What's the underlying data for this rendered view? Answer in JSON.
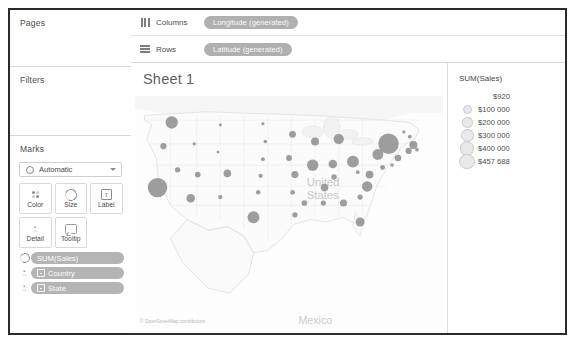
{
  "left_panel": {
    "pages": {
      "title": "Pages"
    },
    "filters": {
      "title": "Filters"
    },
    "marks": {
      "title": "Marks",
      "mark_type": "Automatic",
      "buttons": [
        {
          "label": "Color",
          "icon": "color-dots-icon"
        },
        {
          "label": "Size",
          "icon": "size-circle-icon"
        },
        {
          "label": "Label",
          "icon": "label-text-icon"
        },
        {
          "label": "Detail",
          "icon": "detail-icon"
        },
        {
          "label": "Tooltip",
          "icon": "tooltip-icon"
        }
      ],
      "pills": [
        {
          "label": "SUM(Sales)",
          "icon": "size-circle-icon",
          "has_square": false
        },
        {
          "label": "Country",
          "icon": "detail-icon",
          "has_square": true
        },
        {
          "label": "State",
          "icon": "detail-icon",
          "has_square": true
        }
      ]
    }
  },
  "shelves": [
    {
      "name": "Columns",
      "icon": "columns-icon",
      "pill": "Longitude (generated)"
    },
    {
      "name": "Rows",
      "icon": "rows-icon",
      "pill": "Latitude (generated)"
    }
  ],
  "view": {
    "sheet_title": "Sheet 1",
    "map_credit": "© OpenStreetMap contributors",
    "map_labels": [
      {
        "text": "United States",
        "x": 145,
        "y": 98
      },
      {
        "text": "Mexico",
        "x": 142,
        "y": 213
      }
    ]
  },
  "legend": {
    "title": "SUM(Sales)",
    "entries": [
      {
        "value": "$920",
        "size": 2
      },
      {
        "value": "$100 000",
        "size": 7
      },
      {
        "value": "$200 000",
        "size": 9
      },
      {
        "value": "$300 000",
        "size": 11
      },
      {
        "value": "$400 000",
        "size": 12.5
      },
      {
        "value": "$457 688",
        "size": 13.5
      }
    ]
  },
  "chart_data": {
    "type": "scatter",
    "title": "Sheet 1",
    "xlabel": "Longitude (generated)",
    "ylabel": "Latitude (generated)",
    "size_field": "SUM(Sales)",
    "detail_fields": [
      "Country",
      "State"
    ],
    "size_legend": [
      "$920",
      "$100 000",
      "$200 000",
      "$300 000",
      "$400 000",
      "$457 688"
    ],
    "marks": [
      {
        "state": "Washington",
        "x": 31,
        "y": 42,
        "r": 5.2
      },
      {
        "state": "Oregon",
        "x": 24,
        "y": 62,
        "r": 2.6
      },
      {
        "state": "Idaho",
        "x": 50,
        "y": 60,
        "r": 1.4
      },
      {
        "state": "Montana",
        "x": 72,
        "y": 44,
        "r": 1.3
      },
      {
        "state": "North Dakota",
        "x": 108,
        "y": 43,
        "r": 1.3
      },
      {
        "state": "South Dakota",
        "x": 110,
        "y": 58,
        "r": 1.5
      },
      {
        "state": "Minnesota",
        "x": 133,
        "y": 52,
        "r": 2.9
      },
      {
        "state": "Wisconsin",
        "x": 152,
        "y": 58,
        "r": 3.4
      },
      {
        "state": "Michigan",
        "x": 172,
        "y": 56,
        "r": 4.3
      },
      {
        "state": "Wyoming",
        "x": 70,
        "y": 67,
        "r": 1.2
      },
      {
        "state": "Nevada",
        "x": 36,
        "y": 82,
        "r": 2.3
      },
      {
        "state": "California",
        "x": 19,
        "y": 97,
        "r": 8.2
      },
      {
        "state": "Utah",
        "x": 53,
        "y": 86,
        "r": 2.4
      },
      {
        "state": "Colorado",
        "x": 78,
        "y": 85,
        "r": 3.2
      },
      {
        "state": "Nebraska",
        "x": 108,
        "y": 73,
        "r": 1.6
      },
      {
        "state": "Iowa",
        "x": 130,
        "y": 72,
        "r": 2.5
      },
      {
        "state": "Illinois",
        "x": 150,
        "y": 78,
        "r": 4.8
      },
      {
        "state": "Indiana",
        "x": 167,
        "y": 77,
        "r": 3.6
      },
      {
        "state": "Ohio",
        "x": 184,
        "y": 75,
        "r": 5.0
      },
      {
        "state": "Pennsylvania",
        "x": 205,
        "y": 69,
        "r": 4.6
      },
      {
        "state": "New York",
        "x": 214,
        "y": 60,
        "r": 8.6
      },
      {
        "state": "Vermont",
        "x": 227,
        "y": 50,
        "r": 1.4
      },
      {
        "state": "New Hampshire",
        "x": 232,
        "y": 54,
        "r": 1.6
      },
      {
        "state": "Massachusetts",
        "x": 235,
        "y": 61,
        "r": 3.4
      },
      {
        "state": "Rhode Island",
        "x": 238,
        "y": 65,
        "r": 1.6
      },
      {
        "state": "Connecticut",
        "x": 231,
        "y": 66,
        "r": 2.6
      },
      {
        "state": "New Jersey",
        "x": 222,
        "y": 72,
        "r": 2.8
      },
      {
        "state": "Delaware",
        "x": 217,
        "y": 78,
        "r": 1.5
      },
      {
        "state": "Maryland",
        "x": 209,
        "y": 80,
        "r": 2.1
      },
      {
        "state": "Virginia",
        "x": 198,
        "y": 86,
        "r": 3.3
      },
      {
        "state": "West Virginia",
        "x": 188,
        "y": 84,
        "r": 1.6
      },
      {
        "state": "Kentucky",
        "x": 168,
        "y": 88,
        "r": 2.3
      },
      {
        "state": "Missouri",
        "x": 135,
        "y": 86,
        "r": 3.0
      },
      {
        "state": "Kansas",
        "x": 106,
        "y": 87,
        "r": 1.8
      },
      {
        "state": "Oklahoma",
        "x": 104,
        "y": 101,
        "r": 1.9
      },
      {
        "state": "Arizona",
        "x": 47,
        "y": 106,
        "r": 3.6
      },
      {
        "state": "New Mexico",
        "x": 72,
        "y": 105,
        "r": 1.8
      },
      {
        "state": "Texas",
        "x": 100,
        "y": 122,
        "r": 5.0
      },
      {
        "state": "Arkansas",
        "x": 133,
        "y": 101,
        "r": 2.0
      },
      {
        "state": "Tennessee",
        "x": 160,
        "y": 97,
        "r": 3.2
      },
      {
        "state": "North Carolina",
        "x": 196,
        "y": 96,
        "r": 4.4
      },
      {
        "state": "South Carolina",
        "x": 190,
        "y": 105,
        "r": 2.2
      },
      {
        "state": "Georgia",
        "x": 176,
        "y": 110,
        "r": 3.0
      },
      {
        "state": "Alabama",
        "x": 159,
        "y": 110,
        "r": 2.2
      },
      {
        "state": "Mississippi",
        "x": 143,
        "y": 110,
        "r": 2.4
      },
      {
        "state": "Louisiana",
        "x": 135,
        "y": 120,
        "r": 2.2
      },
      {
        "state": "Florida",
        "x": 190,
        "y": 126,
        "r": 3.8
      }
    ]
  },
  "colors": {
    "mark_fill": "#8c8c8c",
    "pill_bg": "#b2b2b2",
    "panel_border": "#d6d6d6",
    "frame": "#2b2b2b",
    "legend_bubble": "#e9e9e9"
  }
}
